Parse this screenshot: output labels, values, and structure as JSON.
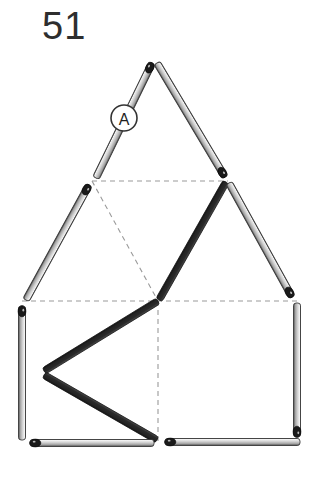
{
  "page": {
    "number_label": "51",
    "background_color": "#ffffff"
  },
  "annotation": {
    "marker_label": "A",
    "marker_cx": 124,
    "marker_cy": 118,
    "marker_r": 13,
    "marker_fill": "#ffffff",
    "marker_stroke": "#333333"
  },
  "style": {
    "match_light_body": "#d0d0d0",
    "match_light_edge": "#3a3a3a",
    "match_dark_body": "#2b2b2b",
    "match_head": "#1a1a1a",
    "dashed_stroke": "#9a9a9a",
    "match_width": 7,
    "dark_match_width": 7
  },
  "matches": [
    {
      "id": "m1",
      "name": "apex-left-upper",
      "shade": "light",
      "head": "end",
      "x1": 96,
      "y1": 178,
      "x2": 152,
      "y2": 63
    },
    {
      "id": "m2",
      "name": "apex-right-upper",
      "shade": "light",
      "head": "end",
      "x1": 157,
      "y1": 63,
      "x2": 225,
      "y2": 177
    },
    {
      "id": "m3",
      "name": "left-outer-slope",
      "shade": "light",
      "head": "start",
      "x1": 89,
      "y1": 185,
      "x2": 26,
      "y2": 300
    },
    {
      "id": "m4",
      "name": "inner-left-dark-slope",
      "shade": "dark",
      "head": "none",
      "x1": 226,
      "y1": 182,
      "x2": 159,
      "y2": 300
    },
    {
      "id": "m5",
      "name": "right-outer-slope",
      "shade": "light",
      "head": "end",
      "x1": 229,
      "y1": 183,
      "x2": 292,
      "y2": 297
    },
    {
      "id": "m6",
      "name": "left-vertical-side",
      "shade": "light",
      "head": "start",
      "x1": 22,
      "y1": 306,
      "x2": 22,
      "y2": 440
    },
    {
      "id": "m7",
      "name": "right-vertical-side",
      "shade": "light",
      "head": "end",
      "x1": 297,
      "y1": 303,
      "x2": 297,
      "y2": 437
    },
    {
      "id": "m8",
      "name": "chevron-upper-dark",
      "shade": "dark",
      "head": "none",
      "x1": 158,
      "y1": 301,
      "x2": 44,
      "y2": 371
    },
    {
      "id": "m9",
      "name": "chevron-lower-dark",
      "shade": "dark",
      "head": "none",
      "x1": 44,
      "y1": 375,
      "x2": 157,
      "y2": 440
    },
    {
      "id": "m10",
      "name": "bottom-left-horizontal",
      "shade": "light",
      "head": "start",
      "x1": 30,
      "y1": 443,
      "x2": 154,
      "y2": 443
    },
    {
      "id": "m11",
      "name": "bottom-right-horizontal",
      "shade": "light",
      "head": "start",
      "x1": 165,
      "y1": 442,
      "x2": 300,
      "y2": 442
    }
  ],
  "dashed_lines": [
    {
      "name": "upper-horizontal-guide",
      "x1": 92,
      "y1": 181,
      "x2": 228,
      "y2": 181
    },
    {
      "name": "diagonal-guide",
      "x1": 92,
      "y1": 181,
      "x2": 158,
      "y2": 301
    },
    {
      "name": "middle-horizontal-guide",
      "x1": 22,
      "y1": 301,
      "x2": 297,
      "y2": 301
    },
    {
      "name": "center-vertical-guide",
      "x1": 158,
      "y1": 301,
      "x2": 158,
      "y2": 441
    }
  ]
}
